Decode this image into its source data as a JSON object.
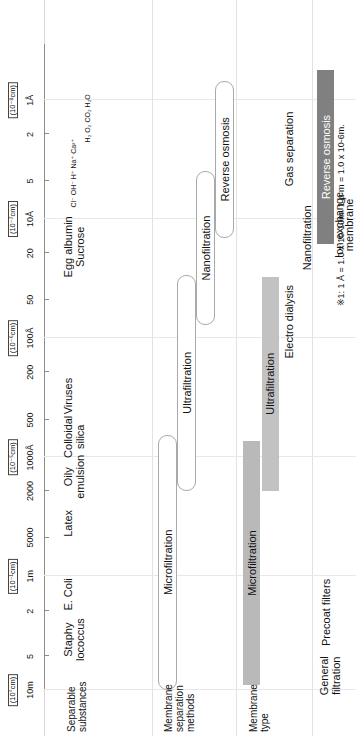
{
  "figure": {
    "footnote": "※1: 1 Å = 1.0 x 10-10m.  1 μ m = 1.0 x 10-6m."
  },
  "row_captions": {
    "substances": "Separable\nsubstances",
    "methods": "Membrane\nseparation\nmethods",
    "membrane_type": "Membrane\ntype"
  },
  "axis": {
    "ticks": [
      {
        "label": "10m",
        "pos": 0.0,
        "major": true
      },
      {
        "label": "5",
        "pos": 0.052,
        "major": false
      },
      {
        "label": "2",
        "pos": 0.122,
        "major": false
      },
      {
        "label": "1m",
        "pos": 0.176,
        "major": true
      },
      {
        "label": "5000",
        "pos": 0.236,
        "major": false
      },
      {
        "label": "2000",
        "pos": 0.308,
        "major": false
      },
      {
        "label": "1000Å",
        "pos": 0.36,
        "major": true
      },
      {
        "label": "500",
        "pos": 0.418,
        "major": false
      },
      {
        "label": "200",
        "pos": 0.492,
        "major": false
      },
      {
        "label": "100Å",
        "pos": 0.545,
        "major": true
      },
      {
        "label": "50",
        "pos": 0.604,
        "major": false
      },
      {
        "label": "20",
        "pos": 0.676,
        "major": false
      },
      {
        "label": "10Å",
        "pos": 0.729,
        "major": true
      },
      {
        "label": "5",
        "pos": 0.788,
        "major": false
      },
      {
        "label": "2",
        "pos": 0.86,
        "major": false
      },
      {
        "label": "1Å",
        "pos": 0.913,
        "major": true
      }
    ],
    "units": [
      {
        "label": "(10°cm)",
        "pos": 0.0
      },
      {
        "label": "(10⁻¹cm)",
        "pos": 0.176
      },
      {
        "label": "(10⁻⁵cm)",
        "pos": 0.36
      },
      {
        "label": "(10⁻⁶cm)",
        "pos": 0.545
      },
      {
        "label": "(10⁻⁷cm)",
        "pos": 0.729
      },
      {
        "label": "(10⁻⁸cm)",
        "pos": 0.913
      }
    ]
  },
  "substances": [
    {
      "label": "Staphy\nlococcus",
      "pos": 0.078
    },
    {
      "label": "E. Coli",
      "pos": 0.148
    },
    {
      "label": "Latex",
      "pos": 0.258
    },
    {
      "label": "Oily\nemulsion",
      "pos": 0.33
    },
    {
      "label": "Colloidal\nsilica",
      "pos": 0.392
    },
    {
      "label": "Viruses",
      "pos": 0.455
    },
    {
      "label": "Egg albumin\nSucrose",
      "pos": 0.686
    }
  ],
  "ion_rows": [
    {
      "items": [
        "Cl⁻",
        "OH⁻",
        "H⁺",
        "Na⁺",
        "Ca²⁺"
      ],
      "pos": 0.8
    },
    {
      "items": [
        "H₂",
        "O₂",
        "CO₂",
        "H₂O"
      ],
      "pos": 0.885
    }
  ],
  "methods": [
    {
      "label": "Microfiltration",
      "start": 0.0,
      "end": 0.392,
      "lane": 0
    },
    {
      "label": "Ultrafiltration",
      "start": 0.308,
      "end": 0.64,
      "lane": 1
    },
    {
      "label": "Nanofiltration",
      "start": 0.565,
      "end": 0.8,
      "lane": 2
    },
    {
      "label": "Reverse osmosis",
      "start": 0.7,
      "end": 0.94,
      "lane": 3
    }
  ],
  "membrane_types": [
    {
      "label": "Microfiltration",
      "start": 0.008,
      "end": 0.385,
      "lane": 0,
      "color": "#b9b9b9",
      "text_color": "#111111",
      "filled": true
    },
    {
      "label": "Ultrafiltration",
      "start": 0.308,
      "end": 0.64,
      "lane": 1,
      "color": "#c2c2c2",
      "text_color": "#111111",
      "filled": true
    },
    {
      "label": "Electro dialysis",
      "start": 0.44,
      "end": 0.7,
      "lane": 2,
      "color": "transparent",
      "text_color": "#111111",
      "filled": false
    },
    {
      "label": "Nanofiltration",
      "start": 0.6,
      "end": 0.8,
      "lane": 3,
      "color": "transparent",
      "text_color": "#111111",
      "filled": false
    },
    {
      "label": "Gas separation",
      "start": 0.73,
      "end": 0.945,
      "lane": 2,
      "color": "transparent",
      "text_color": "#111111",
      "filled": false
    },
    {
      "label": "Reverse osmosis",
      "start": 0.69,
      "end": 0.96,
      "lane": 4,
      "color": "#808080",
      "text_color": "#ffffff",
      "filled": true
    },
    {
      "label": "Ion exchange\nmembrane",
      "start": 0.64,
      "end": 0.8,
      "lane": 5,
      "color": "transparent",
      "text_color": "#111111",
      "filled": false
    }
  ],
  "general": [
    {
      "label": "Precoat filters",
      "pos": 0.12
    },
    {
      "label": "General\nfiltration",
      "pos": 0.022
    }
  ],
  "chart_data": {
    "type": "bar",
    "xlabel": "Particle / molecule size",
    "ylabel": "",
    "orientation": "horizontal-log-scale",
    "grid": true,
    "legend": "none",
    "axis_scale": "log",
    "axis_ticks": [
      "10m",
      "5",
      "2",
      "1m",
      "5000",
      "2000",
      "1000Å",
      "500",
      "200",
      "100Å",
      "50",
      "20",
      "10Å",
      "5",
      "2",
      "1Å"
    ],
    "axis_units": [
      "(10°cm)",
      "(10⁻¹cm)",
      "(10⁻⁵cm)",
      "(10⁻⁶cm)",
      "(10⁻⁷cm)",
      "(10⁻⁸cm)"
    ],
    "categories": [
      "Microfiltration",
      "Ultrafiltration",
      "Nanofiltration",
      "Reverse osmosis",
      "Electro dialysis",
      "Gas separation",
      "Ion exchange membrane"
    ],
    "series": [
      {
        "name": "Membrane separation methods (size range)",
        "ranges": [
          {
            "label": "Microfiltration",
            "from": "10m",
            "to": "1000Å"
          },
          {
            "label": "Ultrafiltration",
            "from": "2000",
            "to": "50"
          },
          {
            "label": "Nanofiltration",
            "from": "200",
            "to": "5"
          },
          {
            "label": "Reverse osmosis",
            "from": "20",
            "to": "1Å"
          }
        ]
      },
      {
        "name": "Membrane type (size range)",
        "ranges": [
          {
            "label": "Microfiltration",
            "from": "10m",
            "to": "1000Å"
          },
          {
            "label": "Ultrafiltration",
            "from": "2000",
            "to": "50"
          },
          {
            "label": "Electro dialysis",
            "from": "500",
            "to": "20"
          },
          {
            "label": "Nanofiltration",
            "from": "200",
            "to": "5"
          },
          {
            "label": "Gas separation",
            "from": "10Å",
            "to": "1Å"
          },
          {
            "label": "Reverse osmosis",
            "from": "20",
            "to": "1Å"
          },
          {
            "label": "Ion exchange membrane",
            "from": "50",
            "to": "5"
          }
        ]
      }
    ],
    "substances": [
      {
        "label": "Staphylococcus",
        "at": "5m"
      },
      {
        "label": "E. Coli",
        "at": "2m"
      },
      {
        "label": "Latex",
        "at": "5000"
      },
      {
        "label": "Oily emulsion",
        "at": "2000"
      },
      {
        "label": "Colloidal silica",
        "at": "1000Å"
      },
      {
        "label": "Viruses",
        "at": "500-200"
      },
      {
        "label": "Egg albumin",
        "at": "20"
      },
      {
        "label": "Sucrose",
        "at": "20"
      },
      {
        "label": "Cl⁻, OH⁻, H⁺, Na⁺, Ca²⁺",
        "at": "5"
      },
      {
        "label": "H₂, O₂, CO₂, H₂O",
        "at": "2"
      }
    ],
    "annotations": [
      "Precoat filters",
      "General filtration",
      "※1: 1 Å = 1.0 x 10-10m.  1 μ m = 1.0 x 10-6m."
    ]
  }
}
